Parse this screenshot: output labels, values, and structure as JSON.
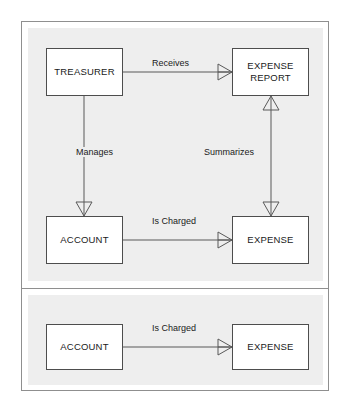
{
  "diagram": {
    "type": "entity-relationship-diagram",
    "notation": "crow's foot",
    "panels": [
      {
        "id": "panel-top",
        "entities": [
          {
            "id": "treasurer",
            "label": "TREASURER"
          },
          {
            "id": "expense-report",
            "label": "EXPENSE\nREPORT",
            "line1": "EXPENSE",
            "line2": "REPORT"
          },
          {
            "id": "account",
            "label": "ACCOUNT"
          },
          {
            "id": "expense",
            "label": "EXPENSE"
          }
        ],
        "relationships": [
          {
            "id": "receives",
            "label": "Receives",
            "from": "treasurer",
            "to": "expense-report",
            "crowfoot_at": "expense-report"
          },
          {
            "id": "manages",
            "label": "Manages",
            "from": "treasurer",
            "to": "account",
            "crowfoot_at": "account"
          },
          {
            "id": "summarizes",
            "label": "Summarizes",
            "from": "expense-report",
            "to": "expense",
            "crowfoot_at": "both"
          },
          {
            "id": "is-charged",
            "label": "Is Charged",
            "from": "account",
            "to": "expense",
            "crowfoot_at": "expense"
          }
        ]
      },
      {
        "id": "panel-bottom",
        "entities": [
          {
            "id": "account-2",
            "label": "ACCOUNT"
          },
          {
            "id": "expense-2",
            "label": "EXPENSE"
          }
        ],
        "relationships": [
          {
            "id": "is-charged-2",
            "label": "Is Charged",
            "from": "account-2",
            "to": "expense-2",
            "crowfoot_at": "expense-2"
          }
        ]
      }
    ],
    "colors": {
      "panel_background": "#eeeeee",
      "entity_fill": "#ffffff",
      "entity_border": "#4d4d4d",
      "connector": "#595959",
      "frame_border": "#8f8f8f",
      "text": "#1a1a1a",
      "page_background": "#ffffff"
    }
  }
}
